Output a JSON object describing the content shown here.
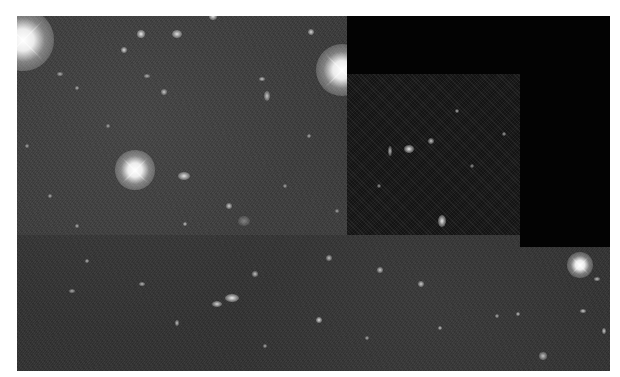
{
  "image": {
    "kind": "astronomical deep-field photograph",
    "frame": {
      "x": 17,
      "y": 16,
      "width": 593,
      "height": 355
    },
    "colors": {
      "page_background": "#ffffff",
      "sky_background": "#3a3a3a",
      "missing_data": "#030303",
      "dark_panel": "#1b1b1b",
      "object": "#ffffff"
    },
    "regions": [
      {
        "name": "missing-data-top",
        "x": 330,
        "y": 0,
        "w": 263,
        "h": 58
      },
      {
        "name": "low-signal-panel",
        "x": 330,
        "y": 58,
        "w": 173,
        "h": 161
      },
      {
        "name": "missing-data-right",
        "x": 503,
        "y": 58,
        "w": 90,
        "h": 173
      }
    ],
    "bright_stars": [
      {
        "x": 6,
        "y": 24,
        "r": 14
      },
      {
        "x": 118,
        "y": 154,
        "r": 9
      },
      {
        "x": 325,
        "y": 54,
        "r": 12
      },
      {
        "x": 563,
        "y": 249,
        "r": 6
      }
    ],
    "objects": [
      {
        "x": 167,
        "y": 160,
        "rx": 6,
        "ry": 4,
        "b": 0.85
      },
      {
        "x": 392,
        "y": 133,
        "rx": 5,
        "ry": 4,
        "b": 0.9
      },
      {
        "x": 425,
        "y": 205,
        "rx": 4,
        "ry": 6,
        "b": 0.9
      },
      {
        "x": 414,
        "y": 125,
        "rx": 3,
        "ry": 3,
        "b": 0.75
      },
      {
        "x": 373,
        "y": 135,
        "rx": 2,
        "ry": 5,
        "b": 0.7
      },
      {
        "x": 215,
        "y": 282,
        "rx": 7,
        "ry": 4,
        "b": 0.9
      },
      {
        "x": 200,
        "y": 288,
        "rx": 5,
        "ry": 3,
        "b": 0.8
      },
      {
        "x": 124,
        "y": 18,
        "rx": 4,
        "ry": 4,
        "b": 0.9
      },
      {
        "x": 160,
        "y": 18,
        "rx": 5,
        "ry": 4,
        "b": 0.85
      },
      {
        "x": 107,
        "y": 34,
        "rx": 3,
        "ry": 3,
        "b": 0.8
      },
      {
        "x": 196,
        "y": 0,
        "rx": 4,
        "ry": 4,
        "b": 0.9
      },
      {
        "x": 294,
        "y": 16,
        "rx": 3,
        "ry": 3,
        "b": 0.8
      },
      {
        "x": 130,
        "y": 60,
        "rx": 3,
        "ry": 2,
        "b": 0.6
      },
      {
        "x": 147,
        "y": 76,
        "rx": 3,
        "ry": 3,
        "b": 0.7
      },
      {
        "x": 245,
        "y": 63,
        "rx": 3,
        "ry": 2,
        "b": 0.7
      },
      {
        "x": 250,
        "y": 80,
        "rx": 3,
        "ry": 5,
        "b": 0.7
      },
      {
        "x": 43,
        "y": 58,
        "rx": 3,
        "ry": 2,
        "b": 0.6
      },
      {
        "x": 60,
        "y": 72,
        "rx": 2,
        "ry": 2,
        "b": 0.6
      },
      {
        "x": 212,
        "y": 190,
        "rx": 3,
        "ry": 3,
        "b": 0.75
      },
      {
        "x": 227,
        "y": 205,
        "rx": 6,
        "ry": 5,
        "b": 0.35
      },
      {
        "x": 168,
        "y": 208,
        "rx": 2,
        "ry": 2,
        "b": 0.7
      },
      {
        "x": 60,
        "y": 210,
        "rx": 2,
        "ry": 2,
        "b": 0.6
      },
      {
        "x": 33,
        "y": 180,
        "rx": 2,
        "ry": 2,
        "b": 0.6
      },
      {
        "x": 70,
        "y": 245,
        "rx": 2,
        "ry": 2,
        "b": 0.65
      },
      {
        "x": 55,
        "y": 275,
        "rx": 3,
        "ry": 2,
        "b": 0.6
      },
      {
        "x": 125,
        "y": 268,
        "rx": 3,
        "ry": 2,
        "b": 0.65
      },
      {
        "x": 160,
        "y": 307,
        "rx": 2,
        "ry": 3,
        "b": 0.7
      },
      {
        "x": 238,
        "y": 258,
        "rx": 3,
        "ry": 3,
        "b": 0.7
      },
      {
        "x": 302,
        "y": 304,
        "rx": 3,
        "ry": 3,
        "b": 0.85
      },
      {
        "x": 248,
        "y": 330,
        "rx": 2,
        "ry": 2,
        "b": 0.6
      },
      {
        "x": 312,
        "y": 242,
        "rx": 3,
        "ry": 3,
        "b": 0.7
      },
      {
        "x": 363,
        "y": 254,
        "rx": 3,
        "ry": 3,
        "b": 0.75
      },
      {
        "x": 404,
        "y": 268,
        "rx": 3,
        "ry": 3,
        "b": 0.75
      },
      {
        "x": 423,
        "y": 312,
        "rx": 2,
        "ry": 2,
        "b": 0.7
      },
      {
        "x": 501,
        "y": 298,
        "rx": 2,
        "ry": 2,
        "b": 0.7
      },
      {
        "x": 526,
        "y": 340,
        "rx": 4,
        "ry": 4,
        "b": 0.7
      },
      {
        "x": 566,
        "y": 295,
        "rx": 3,
        "ry": 2,
        "b": 0.75
      },
      {
        "x": 580,
        "y": 263,
        "rx": 3,
        "ry": 2,
        "b": 0.7
      },
      {
        "x": 587,
        "y": 315,
        "rx": 2,
        "ry": 3,
        "b": 0.75
      },
      {
        "x": 350,
        "y": 322,
        "rx": 2,
        "ry": 2,
        "b": 0.6
      },
      {
        "x": 480,
        "y": 300,
        "rx": 2,
        "ry": 2,
        "b": 0.6
      },
      {
        "x": 440,
        "y": 95,
        "rx": 2,
        "ry": 2,
        "b": 0.65
      },
      {
        "x": 487,
        "y": 118,
        "rx": 2,
        "ry": 2,
        "b": 0.6
      },
      {
        "x": 455,
        "y": 150,
        "rx": 2,
        "ry": 2,
        "b": 0.55
      },
      {
        "x": 362,
        "y": 170,
        "rx": 2,
        "ry": 2,
        "b": 0.55
      },
      {
        "x": 292,
        "y": 120,
        "rx": 2,
        "ry": 2,
        "b": 0.6
      },
      {
        "x": 268,
        "y": 170,
        "rx": 2,
        "ry": 2,
        "b": 0.55
      },
      {
        "x": 91,
        "y": 110,
        "rx": 2,
        "ry": 2,
        "b": 0.55
      },
      {
        "x": 10,
        "y": 130,
        "rx": 2,
        "ry": 2,
        "b": 0.55
      },
      {
        "x": 320,
        "y": 195,
        "rx": 2,
        "ry": 2,
        "b": 0.55
      }
    ]
  }
}
